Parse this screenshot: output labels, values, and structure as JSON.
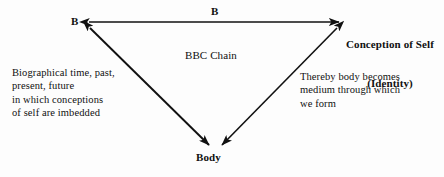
{
  "figure": {
    "background_color": "#fdfdfd",
    "stroke_color": "#111111"
  },
  "nodes": {
    "left": {
      "id": "node-b",
      "label": "B",
      "x": 88,
      "y": 22
    },
    "right": {
      "id": "node-conception-of-self",
      "label_line1": "Conception of Self",
      "label_line2": "(Identity)",
      "x": 340,
      "y": 22
    },
    "bottom": {
      "id": "node-body",
      "label": "Body",
      "x": 215,
      "y": 147
    }
  },
  "edges": {
    "top": {
      "id": "edge-b-to-conception",
      "label": "B",
      "from": "node-b",
      "to": "node-conception-of-self",
      "arrowheads": "both"
    },
    "left": {
      "id": "edge-b-to-body",
      "label": "",
      "from": "node-b",
      "to": "node-body",
      "arrowheads": "both"
    },
    "right": {
      "id": "edge-conception-to-body",
      "label": "",
      "from": "node-conception-of-self",
      "to": "node-body",
      "arrowheads": "both"
    }
  },
  "center": {
    "label": "BBC Chain"
  },
  "notes": {
    "left": "Biographical time, past,\npresent, future\nin which conceptions\nof self are imbedded",
    "right": "Thereby body becomes\nmedium through which\nwe form"
  }
}
